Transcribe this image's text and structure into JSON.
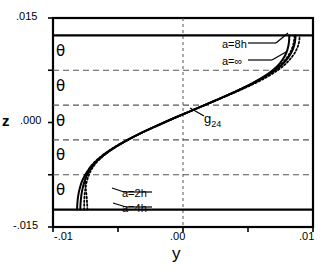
{
  "axes": {
    "y_title": "z",
    "x_title": "y",
    "y_ticks": [
      ".015",
      ".000",
      "-.015"
    ],
    "x_ticks": [
      "-.01",
      ".00",
      ".01"
    ]
  },
  "symbols": {
    "theta": "θ",
    "theta_count": 5
  },
  "annotations": {
    "a8h": "a=8h",
    "ainf": "a=∞",
    "a2h": "a=2h",
    "a4h": "a=4h",
    "curve_label_base": "g",
    "curve_label_sub": "24"
  },
  "colors": {
    "line": "#000000",
    "grid": "#555555",
    "background": "#ffffff"
  },
  "chart_data": {
    "type": "line",
    "title": "",
    "xlabel": "y",
    "ylabel": "z",
    "xlim": [
      -0.01,
      0.01
    ],
    "ylim": [
      -0.015,
      0.015
    ],
    "xtick_values": [
      -0.01,
      -0.005,
      0.0,
      0.005,
      0.01
    ],
    "xtick_labels": [
      "-.01",
      "",
      ".00",
      "",
      ".01"
    ],
    "ytick_values": [
      -0.015,
      -0.0075,
      0.0,
      0.0075,
      0.015
    ],
    "ytick_labels": [
      "-.015",
      "",
      ".000",
      "",
      ".015"
    ],
    "grid": true,
    "grid_y_values": [
      -0.0075,
      -0.0025,
      0.0025,
      0.0075
    ],
    "grid_x_values": [
      0.0
    ],
    "wall_z_values": [
      -0.0125,
      0.0125
    ],
    "legend_position": "inline-annotations",
    "series": [
      {
        "name": "a=2h",
        "style": "solid",
        "points": [
          [
            -0.00815,
            -0.0125
          ],
          [
            -0.00812,
            -0.0115
          ],
          [
            -0.00806,
            -0.0105
          ],
          [
            -0.00795,
            -0.0095
          ],
          [
            -0.00778,
            -0.0085
          ],
          [
            -0.00752,
            -0.0075
          ],
          [
            -0.00715,
            -0.0065
          ],
          [
            -0.00665,
            -0.0055
          ],
          [
            -0.006,
            -0.0045
          ],
          [
            -0.0052,
            -0.0035
          ],
          [
            -0.00425,
            -0.0025
          ],
          [
            -0.0032,
            -0.0015
          ],
          [
            -0.00205,
            -0.0005
          ],
          [
            -0.00085,
            0.0005
          ],
          [
            0.0004,
            0.0015
          ],
          [
            0.00165,
            0.0025
          ],
          [
            0.0029,
            0.0035
          ],
          [
            0.0041,
            0.0045
          ],
          [
            0.0052,
            0.0055
          ],
          [
            0.00615,
            0.0065
          ],
          [
            0.0069,
            0.0075
          ],
          [
            0.00745,
            0.0085
          ],
          [
            0.00782,
            0.0095
          ],
          [
            0.00804,
            0.0105
          ],
          [
            0.00815,
            0.0115
          ],
          [
            0.00818,
            0.0125
          ]
        ]
      },
      {
        "name": "a=4h",
        "style": "dotted",
        "points": [
          [
            -0.00735,
            -0.0125
          ],
          [
            -0.00738,
            -0.0115
          ],
          [
            -0.00742,
            -0.0105
          ],
          [
            -0.00748,
            -0.0095
          ],
          [
            -0.00752,
            -0.0085
          ],
          [
            -0.00745,
            -0.0075
          ],
          [
            -0.00718,
            -0.0065
          ],
          [
            -0.0067,
            -0.0055
          ],
          [
            -0.00605,
            -0.0045
          ],
          [
            -0.00524,
            -0.0035
          ],
          [
            -0.00428,
            -0.0025
          ],
          [
            -0.00322,
            -0.0015
          ],
          [
            -0.00206,
            -0.0005
          ],
          [
            -0.00086,
            0.0005
          ],
          [
            0.00039,
            0.0015
          ],
          [
            0.00164,
            0.0025
          ],
          [
            0.00289,
            0.0035
          ],
          [
            0.00409,
            0.0045
          ],
          [
            0.00521,
            0.0055
          ],
          [
            0.0062,
            0.0065
          ],
          [
            0.007,
            0.0075
          ],
          [
            0.00762,
            0.0085
          ],
          [
            0.00806,
            0.0095
          ],
          [
            0.00836,
            0.0105
          ],
          [
            0.00852,
            0.0115
          ],
          [
            0.00858,
            0.0125
          ]
        ]
      },
      {
        "name": "a=8h",
        "style": "solid",
        "points": [
          [
            -0.0079,
            -0.0125
          ],
          [
            -0.00788,
            -0.0116
          ],
          [
            -0.00783,
            -0.0106
          ],
          [
            -0.00774,
            -0.0096
          ],
          [
            -0.0076,
            -0.0086
          ],
          [
            -0.00738,
            -0.00755
          ],
          [
            -0.00706,
            -0.00652
          ],
          [
            -0.0066,
            -0.00551
          ],
          [
            -0.00598,
            -0.00451
          ],
          [
            -0.00519,
            -0.00351
          ],
          [
            -0.00425,
            -0.0025
          ],
          [
            -0.0032,
            -0.0015
          ],
          [
            -0.00205,
            -0.0005
          ],
          [
            -0.00085,
            0.0005
          ],
          [
            0.0004,
            0.0015
          ],
          [
            0.00166,
            0.0025
          ],
          [
            0.00292,
            0.0035
          ],
          [
            0.00414,
            0.0045
          ],
          [
            0.00528,
            0.0055
          ],
          [
            0.00628,
            0.0065
          ],
          [
            0.0071,
            0.0075
          ],
          [
            0.00772,
            0.0085
          ],
          [
            0.00816,
            0.0095
          ],
          [
            0.00845,
            0.0105
          ],
          [
            0.00861,
            0.0115
          ],
          [
            0.00866,
            0.0125
          ]
        ]
      },
      {
        "name": "a=∞",
        "style": "dotted",
        "points": [
          [
            -0.0076,
            -0.0125
          ],
          [
            -0.0076,
            -0.0116
          ],
          [
            -0.00758,
            -0.0106
          ],
          [
            -0.00752,
            -0.0096
          ],
          [
            -0.00742,
            -0.0086
          ],
          [
            -0.00724,
            -0.00755
          ],
          [
            -0.00697,
            -0.00652
          ],
          [
            -0.00654,
            -0.00551
          ],
          [
            -0.00594,
            -0.00451
          ],
          [
            -0.00516,
            -0.00351
          ],
          [
            -0.00423,
            -0.0025
          ],
          [
            -0.00319,
            -0.0015
          ],
          [
            -0.00205,
            -0.0005
          ],
          [
            -0.00084,
            0.0005
          ],
          [
            0.00042,
            0.0015
          ],
          [
            0.00169,
            0.0025
          ],
          [
            0.00297,
            0.0035
          ],
          [
            0.00421,
            0.0045
          ],
          [
            0.00538,
            0.0055
          ],
          [
            0.00642,
            0.0065
          ],
          [
            0.00728,
            0.0075
          ],
          [
            0.00794,
            0.0085
          ],
          [
            0.00842,
            0.0095
          ],
          [
            0.00874,
            0.0105
          ],
          [
            0.00892,
            0.0115
          ],
          [
            0.00898,
            0.0125
          ]
        ]
      }
    ]
  }
}
